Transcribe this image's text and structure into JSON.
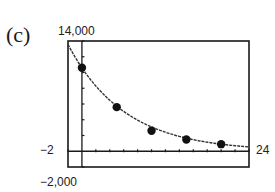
{
  "part_label": "(c)",
  "window": {
    "ymax_label": "14,000",
    "ymin_label": "−2,000",
    "xmin_label": "−2",
    "xmax_label": "24"
  },
  "chart_data": {
    "type": "scatter",
    "title": "",
    "xlabel": "",
    "ylabel": "",
    "xlim": [
      -2,
      24
    ],
    "ylim": [
      -2000,
      14000
    ],
    "x_tick_step": 2,
    "y_tick_step": 2000,
    "grid": false,
    "series": [
      {
        "name": "data points",
        "x": [
          0,
          5,
          10,
          15,
          20
        ],
        "y": [
          10600,
          5600,
          2600,
          1500,
          900
        ]
      },
      {
        "name": "exponential model curve",
        "type": "line",
        "x": [
          -2,
          0,
          5,
          10,
          15,
          20,
          24
        ],
        "y": [
          13800,
          10600,
          5600,
          2900,
          1600,
          900,
          700
        ]
      }
    ]
  }
}
